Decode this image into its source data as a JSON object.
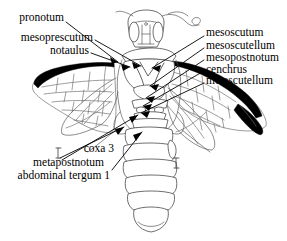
{
  "figure": {
    "background_color": "#ffffff",
    "ink_color": "#000000",
    "line_color": "#5a5a5a",
    "accent_black": "#000000",
    "width": 287,
    "height": 241
  },
  "labels": {
    "left": [
      {
        "id": "pronotum",
        "text": "pronotum",
        "x": 64,
        "y": 17,
        "align": "right"
      },
      {
        "id": "mesoprescutum",
        "text": "mesoprescutum",
        "x": 93,
        "y": 37,
        "align": "right"
      },
      {
        "id": "notaulus",
        "text": "notaulus",
        "x": 89,
        "y": 50,
        "align": "right"
      }
    ],
    "right": [
      {
        "id": "mesoscutum",
        "text": "mesoscutum",
        "x": 206,
        "y": 32,
        "align": "left"
      },
      {
        "id": "mesoscutellum",
        "text": "mesoscutellum",
        "x": 206,
        "y": 45,
        "align": "left"
      },
      {
        "id": "mesopostnotum",
        "text": "mesopostnotum",
        "x": 206,
        "y": 57,
        "align": "left"
      },
      {
        "id": "cenchrus",
        "text": "cenchrus",
        "x": 206,
        "y": 69,
        "align": "left"
      },
      {
        "id": "metascutellum",
        "text": "metascutellum",
        "x": 206,
        "y": 80,
        "align": "left"
      }
    ],
    "lower_left": [
      {
        "id": "coxa-3",
        "text": "coxa 3",
        "x": 114,
        "y": 148,
        "align": "right"
      },
      {
        "id": "metapostnotum",
        "text": "metapostnotum",
        "x": 104,
        "y": 162,
        "align": "right"
      },
      {
        "id": "abdominal-tergum-1",
        "text": "abdominal tergum 1",
        "x": 110,
        "y": 175,
        "align": "right"
      }
    ]
  },
  "leaders": {
    "pronotum": "M 66,22 L 118,62",
    "mesoprescutum": "M 95,40 L 131,64",
    "notaulus": "M 91,53 L 128,66",
    "mesoscutum": "M 204,36 L 150,66",
    "mesoscutellum": "M 204,48 L 148,84",
    "mesopostnotum": "M 204,60 L 144,96",
    "cenchrus": "M 204,71 L 140,104",
    "metascutellum": "M 204,83 L 138,110",
    "coxa-3": "M 60,158 L 123,126",
    "metapostnotum": "M 62,160 L 137,114",
    "abdominal-tergum-1": "M 112,170 L 141,131"
  },
  "anatomy": {
    "head": "head capsule with compound eyes, ocelli and antennae",
    "thorax": "pronotum, mesoscutum with notauli, mesoscutellum, mesopostnotum, cenchri, metascutellum, metapostnotum",
    "abdomen": "six visible terga tapering to rounded apex",
    "wings": "fore and hind wings with dark costal margin and pterostigma"
  }
}
